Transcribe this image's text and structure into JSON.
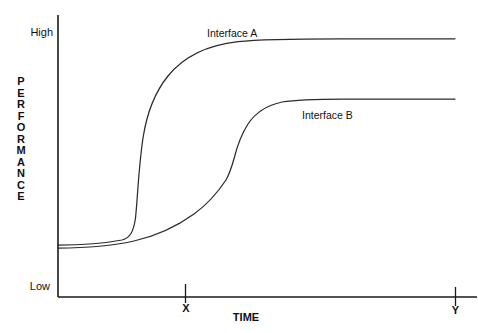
{
  "chart_data": {
    "type": "line",
    "title": "",
    "subtitle": "",
    "xlabel": "TIME",
    "ylabel": "PERFORMANCE",
    "grid": false,
    "legend_position": "inline-annotation",
    "axes": {
      "y": {
        "label": "PERFORMANCE",
        "tick_labels": [
          "High",
          "Low"
        ],
        "high_label": "High",
        "low_label": "Low",
        "range_text": "Low to High",
        "ylim": [
          0,
          1
        ]
      },
      "x": {
        "label": "TIME",
        "tick_labels": [
          "X",
          "Y"
        ],
        "tick_x_label": "X",
        "tick_y_label": "Y",
        "xlim": [
          0,
          1
        ]
      }
    },
    "series": [
      {
        "name": "Interface A",
        "annotation": "Interface A",
        "color": "#2b2b2b",
        "description": "Steep early sigmoid: low plateau, abrupt rise before tick X, high plateau",
        "x": [
          0.0,
          0.05,
          0.1,
          0.14,
          0.17,
          0.18,
          0.19,
          0.2,
          0.22,
          0.25,
          0.3,
          0.36,
          0.44,
          0.52,
          0.6,
          0.7,
          0.8,
          0.9,
          1.0
        ],
        "y": [
          0.055,
          0.058,
          0.065,
          0.09,
          0.2,
          0.33,
          0.47,
          0.58,
          0.69,
          0.76,
          0.83,
          0.88,
          0.925,
          0.95,
          0.962,
          0.968,
          0.97,
          0.97,
          0.97
        ]
      },
      {
        "name": "Interface B",
        "annotation": "Interface B",
        "color": "#2b2b2b",
        "description": "Gradual double-inflection rise: slow climb, second knee near mid-range, lower plateau",
        "x": [
          0.0,
          0.06,
          0.12,
          0.18,
          0.24,
          0.3,
          0.36,
          0.4,
          0.43,
          0.45,
          0.47,
          0.5,
          0.54,
          0.58,
          0.64,
          0.72,
          0.82,
          0.92,
          1.0
        ],
        "y": [
          0.045,
          0.048,
          0.06,
          0.09,
          0.14,
          0.215,
          0.3,
          0.365,
          0.43,
          0.5,
          0.57,
          0.65,
          0.705,
          0.732,
          0.742,
          0.745,
          0.745,
          0.745,
          0.745
        ]
      }
    ],
    "annotations": [
      {
        "text": "Interface A",
        "series": "Interface A"
      },
      {
        "text": "Interface B",
        "series": "Interface B"
      },
      {
        "text": "High",
        "role": "y-axis-max-tick"
      },
      {
        "text": "Low",
        "role": "y-axis-min-tick"
      },
      {
        "text": "X",
        "role": "x-axis-tick"
      },
      {
        "text": "Y",
        "role": "x-axis-tick"
      },
      {
        "text": "TIME",
        "role": "x-axis-title"
      },
      {
        "text": "PERFORMANCE",
        "role": "y-axis-title"
      }
    ]
  },
  "axis_title_y_letters": [
    "P",
    "E",
    "R",
    "F",
    "O",
    "R",
    "M",
    "A",
    "N",
    "C",
    "E"
  ],
  "colors": {
    "background": "#ffffff",
    "axis": "#1a1a1a",
    "curve": "#2b2b2b",
    "text": "#111111"
  }
}
